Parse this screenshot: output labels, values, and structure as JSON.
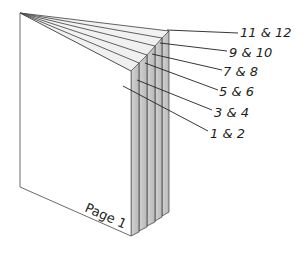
{
  "diagram": {
    "type": "booklet-page-layout",
    "front_page_label": "Page 1",
    "sheets": [
      {
        "label": "1 & 2",
        "label_x": 211,
        "label_y": 138,
        "leader": [
          123,
          86,
          208,
          131
        ]
      },
      {
        "label": "3 & 4",
        "label_x": 215,
        "label_y": 117,
        "leader": [
          139,
          80,
          212,
          110
        ]
      },
      {
        "label": "5 & 6",
        "label_x": 220,
        "label_y": 96,
        "leader": [
          147,
          63,
          218,
          90
        ]
      },
      {
        "label": "7 & 8",
        "label_x": 224,
        "label_y": 76,
        "leader": [
          155,
          55,
          222,
          70
        ]
      },
      {
        "label": "9 & 10",
        "label_x": 229,
        "label_y": 57,
        "leader": [
          162,
          44,
          227,
          51
        ]
      },
      {
        "label": "11 & 12",
        "label_x": 240,
        "label_y": 36,
        "leader": [
          169,
          30,
          238,
          33
        ]
      }
    ],
    "colors": {
      "stroke": "#3a3a3a",
      "page_fill": "#ffffff",
      "edge_fill": "#c9c9c9",
      "edge_fill_light": "#e6e6e6",
      "text": "#231f20"
    }
  }
}
